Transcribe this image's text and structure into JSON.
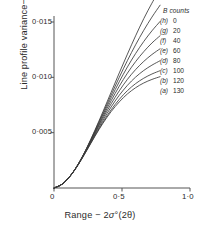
{
  "chart_data": {
    "type": "line",
    "title": "",
    "xlabel": "Range − 2σ°(2θ)",
    "ylabel": "Line profile variance−W[°(2θ)]²",
    "xlim": [
      0,
      1.0
    ],
    "ylim": [
      0,
      0.0165
    ],
    "grid": false,
    "legend_position": "top-right",
    "legend_title": "B counts",
    "xticks": [
      {
        "value": 0,
        "label": "0"
      },
      {
        "value": 0.5,
        "label": "0·5"
      },
      {
        "value": 1.0,
        "label": "1·0"
      }
    ],
    "yticks": [
      {
        "value": 0.005,
        "label": "0·005"
      },
      {
        "value": 0.01,
        "label": "0·010"
      },
      {
        "value": 0.015,
        "label": "0·015"
      }
    ],
    "series": [
      {
        "name": "h",
        "key": "(h)",
        "background_counts": 0,
        "x": [
          0,
          0.06,
          0.12,
          0.18,
          0.24,
          0.3,
          0.36,
          0.42,
          0.48,
          0.54,
          0.6,
          0.66,
          0.72,
          0.78
        ],
        "y": [
          0,
          0.00035,
          0.0011,
          0.0022,
          0.0036,
          0.0052,
          0.0069,
          0.00865,
          0.0104,
          0.0121,
          0.01375,
          0.0153,
          0.0167,
          0.018
        ]
      },
      {
        "name": "g",
        "key": "(g)",
        "background_counts": 20,
        "x": [
          0,
          0.06,
          0.12,
          0.18,
          0.24,
          0.3,
          0.36,
          0.42,
          0.48,
          0.54,
          0.6,
          0.66,
          0.72,
          0.78
        ],
        "y": [
          0,
          0.00035,
          0.0011,
          0.0022,
          0.00358,
          0.00514,
          0.00676,
          0.0084,
          0.01,
          0.01152,
          0.01294,
          0.01425,
          0.01544,
          0.01652
        ]
      },
      {
        "name": "f",
        "key": "(f)",
        "background_counts": 40,
        "x": [
          0,
          0.06,
          0.12,
          0.18,
          0.24,
          0.3,
          0.36,
          0.42,
          0.48,
          0.54,
          0.6,
          0.66,
          0.72,
          0.78
        ],
        "y": [
          0,
          0.00035,
          0.0011,
          0.00219,
          0.00355,
          0.00507,
          0.00662,
          0.00815,
          0.0096,
          0.01094,
          0.01215,
          0.01324,
          0.0142,
          0.01505
        ]
      },
      {
        "name": "e",
        "key": "(e)",
        "background_counts": 60,
        "x": [
          0,
          0.06,
          0.12,
          0.18,
          0.24,
          0.3,
          0.36,
          0.42,
          0.48,
          0.54,
          0.6,
          0.66,
          0.72,
          0.78
        ],
        "y": [
          0,
          0.00035,
          0.0011,
          0.00218,
          0.00352,
          0.00499,
          0.00646,
          0.00788,
          0.0092,
          0.01038,
          0.01142,
          0.01232,
          0.0131,
          0.01376
        ]
      },
      {
        "name": "d",
        "key": "(d)",
        "background_counts": 80,
        "x": [
          0,
          0.06,
          0.12,
          0.18,
          0.24,
          0.3,
          0.36,
          0.42,
          0.48,
          0.54,
          0.6,
          0.66,
          0.72,
          0.78
        ],
        "y": [
          0,
          0.00035,
          0.0011,
          0.00217,
          0.00348,
          0.0049,
          0.0063,
          0.0076,
          0.00878,
          0.00982,
          0.0107,
          0.01144,
          0.01206,
          0.01258
        ]
      },
      {
        "name": "c",
        "key": "(c)",
        "background_counts": 100,
        "x": [
          0,
          0.06,
          0.12,
          0.18,
          0.24,
          0.3,
          0.36,
          0.42,
          0.48,
          0.54,
          0.6,
          0.66,
          0.72,
          0.78
        ],
        "y": [
          0,
          0.00035,
          0.0011,
          0.00216,
          0.00344,
          0.0048,
          0.00612,
          0.00732,
          0.00838,
          0.00928,
          0.01002,
          0.01062,
          0.0111,
          0.0115
        ]
      },
      {
        "name": "b",
        "key": "(b)",
        "background_counts": 120,
        "x": [
          0,
          0.06,
          0.12,
          0.18,
          0.24,
          0.3,
          0.36,
          0.42,
          0.48,
          0.54,
          0.6,
          0.66,
          0.72,
          0.78
        ],
        "y": [
          0,
          0.00035,
          0.0011,
          0.00215,
          0.0034,
          0.00471,
          0.00595,
          0.00706,
          0.00801,
          0.0088,
          0.00943,
          0.00992,
          0.0103,
          0.0106
        ]
      },
      {
        "name": "a",
        "key": "(a)",
        "background_counts": 130,
        "x": [
          0,
          0.06,
          0.12,
          0.18,
          0.24,
          0.3,
          0.36,
          0.42,
          0.48,
          0.54,
          0.6,
          0.66,
          0.72,
          0.78
        ],
        "y": [
          0,
          0.00035,
          0.0011,
          0.00214,
          0.00337,
          0.00465,
          0.00585,
          0.0069,
          0.00778,
          0.0085,
          0.00906,
          0.00949,
          0.00981,
          0.01006
        ]
      }
    ]
  },
  "axes": {
    "ylabel_prefix": "Line profile variance−",
    "ylabel_w": "W",
    "ylabel_unit": "[°(2θ)]",
    "ylabel_exp": "2",
    "xlabel_prefix": "Range − 2",
    "xlabel_sigma": "σ",
    "xlabel_deg": "°",
    "xlabel_unit": "(2θ)",
    "ytick_0": "0·015",
    "ytick_1": "0·010",
    "ytick_2": "0·005",
    "xtick_0": "0",
    "xtick_1": "0·5",
    "xtick_2": "1·0"
  },
  "legend": {
    "title": "B counts",
    "rows": [
      {
        "key": "(h)",
        "value": "0"
      },
      {
        "key": "(g)",
        "value": "20"
      },
      {
        "key": "(f)",
        "value": "40"
      },
      {
        "key": "(e)",
        "value": "60"
      },
      {
        "key": "(d)",
        "value": "80"
      },
      {
        "key": "(c)",
        "value": "100"
      },
      {
        "key": "(b)",
        "value": "120"
      },
      {
        "key": "(a)",
        "value": "130"
      }
    ]
  },
  "style": {
    "line_color": "#3a3a3a",
    "axis_color": "#555555",
    "text_color": "#2b2b2b"
  }
}
